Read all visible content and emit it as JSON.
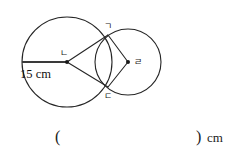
{
  "figure": {
    "type": "two-intersecting-circles-geometry-diagram",
    "large_circle": {
      "center_label": "ㄴ",
      "cx": 67,
      "cy": 62,
      "r": 45
    },
    "small_circle": {
      "center_label": "ㄹ",
      "cx": 128,
      "cy": 62,
      "r": 33
    },
    "intersection_points": [
      {
        "label": "ㄱ",
        "x": 108,
        "y": 35
      },
      {
        "label": "ㄷ",
        "x": 108,
        "y": 87
      }
    ],
    "segments": [
      {
        "name": "radius-marker",
        "from": "edge",
        "to": "ㄴ",
        "x1": 22,
        "y1": 62,
        "x2": 67,
        "y2": 62
      },
      {
        "name": "segment-na-ga",
        "from": "ㄴ",
        "to": "ㄱ",
        "x1": 67,
        "y1": 62,
        "x2": 108,
        "y2": 35
      },
      {
        "name": "segment-na-da",
        "from": "ㄴ",
        "to": "ㄷ",
        "x1": 67,
        "y1": 62,
        "x2": 108,
        "y2": 87
      },
      {
        "name": "segment-ga-ra",
        "from": "ㄱ",
        "to": "ㄹ",
        "x1": 108,
        "y1": 35,
        "x2": 128,
        "y2": 62
      },
      {
        "name": "segment-da-ra",
        "from": "ㄷ",
        "to": "ㄹ",
        "x1": 108,
        "y1": 87,
        "x2": 128,
        "y2": 62
      }
    ],
    "dimension_label": "15 cm",
    "label_ga": "ㄱ",
    "label_na": "ㄴ",
    "label_da": "ㄷ",
    "label_ra": "ㄹ"
  },
  "answer": {
    "paren_open": "(",
    "paren_close": ")",
    "unit": "cm",
    "value": ""
  },
  "colors": {
    "stroke": "#262626",
    "radius_stroke": "#3a3a3a",
    "text": "#1a1a1a",
    "background": "#ffffff"
  }
}
